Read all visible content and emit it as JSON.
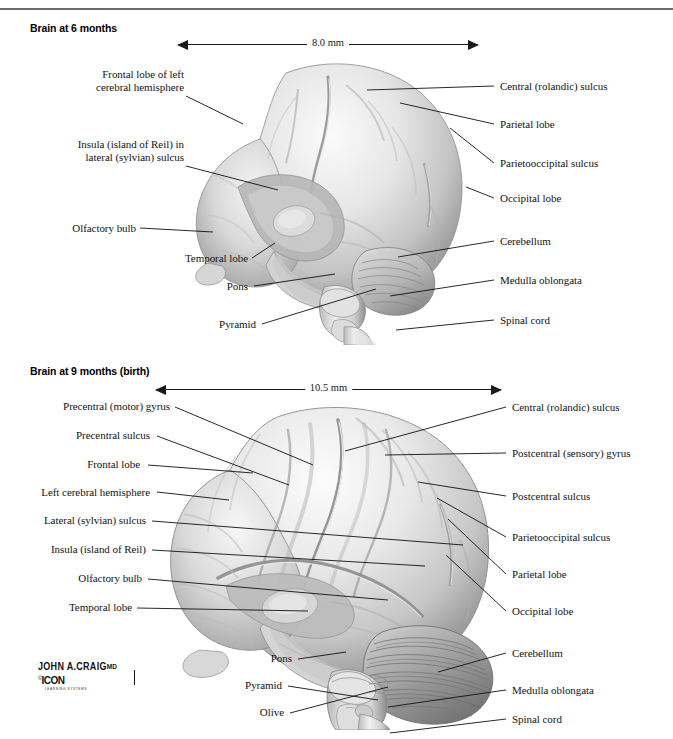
{
  "figures": [
    {
      "id": "brain-6-months",
      "title": "Brain at 6 months",
      "scale": {
        "value": "8.0 mm"
      },
      "labels_left": [
        {
          "name": "frontal-lobe-left-hemisphere",
          "text": "Frontal lobe of left\ncerebral hemisphere"
        },
        {
          "name": "insula-lateral-sulcus",
          "text": "Insula (island of Reil) in\nlateral (sylvian) sulcus"
        },
        {
          "name": "olfactory-bulb",
          "text": "Olfactory bulb"
        },
        {
          "name": "temporal-lobe",
          "text": "Temporal lobe"
        },
        {
          "name": "pons",
          "text": "Pons"
        },
        {
          "name": "pyramid",
          "text": "Pyramid"
        }
      ],
      "labels_right": [
        {
          "name": "central-rolandic-sulcus",
          "text": "Central (rolandic) sulcus"
        },
        {
          "name": "parietal-lobe",
          "text": "Parietal lobe"
        },
        {
          "name": "parietooccipital-sulcus",
          "text": "Parietooccipital sulcus"
        },
        {
          "name": "occipital-lobe",
          "text": "Occipital lobe"
        },
        {
          "name": "cerebellum",
          "text": "Cerebellum"
        },
        {
          "name": "medulla-oblongata",
          "text": "Medulla oblongata"
        },
        {
          "name": "spinal-cord",
          "text": "Spinal cord"
        }
      ]
    },
    {
      "id": "brain-9-months",
      "title": "Brain at 9 months (birth)",
      "scale": {
        "value": "10.5 mm"
      },
      "labels_left": [
        {
          "name": "precentral-motor-gyrus",
          "text": "Precentral (motor) gyrus"
        },
        {
          "name": "precentral-sulcus",
          "text": "Precentral sulcus"
        },
        {
          "name": "frontal-lobe",
          "text": "Frontal lobe"
        },
        {
          "name": "left-cerebral-hemisphere",
          "text": "Left cerebral hemisphere"
        },
        {
          "name": "lateral-sylvian-sulcus",
          "text": "Lateral (sylvian) sulcus"
        },
        {
          "name": "insula-island-of-reil",
          "text": "Insula (island of Reil)"
        },
        {
          "name": "olfactory-bulb",
          "text": "Olfactory bulb"
        },
        {
          "name": "temporal-lobe",
          "text": "Temporal lobe"
        },
        {
          "name": "pons",
          "text": "Pons"
        },
        {
          "name": "pyramid",
          "text": "Pyramid"
        },
        {
          "name": "olive",
          "text": "Olive"
        }
      ],
      "labels_right": [
        {
          "name": "central-rolandic-sulcus",
          "text": "Central (rolandic) sulcus"
        },
        {
          "name": "postcentral-sensory-gyrus",
          "text": "Postcentral (sensory) gyrus"
        },
        {
          "name": "postcentral-sulcus",
          "text": "Postcentral sulcus"
        },
        {
          "name": "parietooccipital-sulcus",
          "text": "Parietooccipital sulcus"
        },
        {
          "name": "parietal-lobe",
          "text": "Parietal lobe"
        },
        {
          "name": "occipital-lobe",
          "text": "Occipital lobe"
        },
        {
          "name": "cerebellum",
          "text": "Cerebellum"
        },
        {
          "name": "medulla-oblongata",
          "text": "Medulla oblongata"
        },
        {
          "name": "spinal-cord",
          "text": "Spinal cord"
        }
      ]
    }
  ],
  "signature": {
    "artist": "JOHN A.CRAIG",
    "credential": "MD",
    "copyright_symbol": "©",
    "publisher": "ICON",
    "publisher_sub": "LEARNING SYSTEMS"
  },
  "colors": {
    "rule": "#6b6b6b",
    "leader": "#111111",
    "text": "#141414",
    "brain_light": "#f2f2f2",
    "brain_mid": "#d4d4d4",
    "brain_dark": "#9a9a9a",
    "brain_shadow": "#6e6e6e"
  }
}
